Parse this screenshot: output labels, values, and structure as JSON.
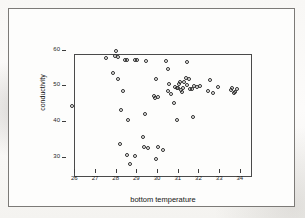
{
  "figure": {
    "background_color": "#f7f6f4",
    "border_color": "#7c7a77",
    "axis_color": "#4a4a4a",
    "marker_color": "#2e2e2e"
  },
  "chart_data": {
    "type": "scatter",
    "title": "",
    "xlabel": "bottom temperature",
    "ylabel": "conductivity",
    "xlim": [
      25.6,
      34.2
    ],
    "ylim": [
      26.5,
      61.0
    ],
    "xticks": [
      26,
      27,
      28,
      29,
      30,
      31,
      32,
      33,
      34
    ],
    "yticks": [
      30,
      40,
      50,
      60
    ],
    "xticklabels": [
      "26",
      "27",
      "28",
      "29",
      "30",
      "31",
      "32",
      "33",
      "34"
    ],
    "yticklabels": [
      "30",
      "40",
      "50",
      "60"
    ],
    "grid": false,
    "legend": false,
    "marker": "open-circle",
    "n_points": 65,
    "points": [
      [
        25.9,
        44.1
      ],
      [
        27.55,
        57.6
      ],
      [
        27.95,
        58.3
      ],
      [
        28.0,
        59.6
      ],
      [
        28.1,
        58.0
      ],
      [
        28.45,
        57.0
      ],
      [
        28.55,
        57.1
      ],
      [
        28.95,
        57.2
      ],
      [
        29.05,
        57.2
      ],
      [
        29.45,
        56.9
      ],
      [
        27.85,
        53.3
      ],
      [
        28.1,
        51.8
      ],
      [
        28.35,
        48.3
      ],
      [
        28.25,
        43.0
      ],
      [
        28.6,
        40.2
      ],
      [
        28.2,
        33.4
      ],
      [
        28.55,
        30.4
      ],
      [
        28.7,
        28.0
      ],
      [
        28.95,
        30.1
      ],
      [
        29.3,
        35.6
      ],
      [
        29.35,
        32.6
      ],
      [
        29.55,
        32.4
      ],
      [
        29.4,
        42.0
      ],
      [
        29.95,
        29.2
      ],
      [
        30.05,
        32.6
      ],
      [
        30.3,
        31.9
      ],
      [
        29.95,
        51.8
      ],
      [
        29.85,
        46.9
      ],
      [
        29.9,
        46.3
      ],
      [
        30.05,
        46.6
      ],
      [
        30.45,
        56.8
      ],
      [
        30.55,
        54.6
      ],
      [
        31.45,
        56.5
      ],
      [
        30.6,
        50.4
      ],
      [
        30.55,
        48.5
      ],
      [
        30.65,
        47.6
      ],
      [
        30.8,
        45.1
      ],
      [
        30.85,
        49.4
      ],
      [
        30.95,
        49.2
      ],
      [
        31.0,
        49.3
      ],
      [
        31.05,
        50.3
      ],
      [
        31.1,
        51.0
      ],
      [
        31.15,
        48.6
      ],
      [
        31.2,
        48.2
      ],
      [
        31.25,
        49.1
      ],
      [
        31.3,
        50.9
      ],
      [
        31.4,
        51.9
      ],
      [
        31.45,
        50.2
      ],
      [
        31.55,
        51.8
      ],
      [
        31.6,
        49.0
      ],
      [
        31.7,
        48.8
      ],
      [
        31.8,
        49.9
      ],
      [
        31.95,
        49.4
      ],
      [
        32.05,
        49.7
      ],
      [
        30.95,
        40.3
      ],
      [
        31.75,
        41.2
      ],
      [
        32.45,
        48.3
      ],
      [
        32.55,
        51.5
      ],
      [
        32.7,
        47.9
      ],
      [
        32.95,
        49.5
      ],
      [
        33.55,
        48.6
      ],
      [
        33.6,
        49.2
      ],
      [
        33.7,
        47.8
      ],
      [
        33.75,
        48.0
      ],
      [
        33.85,
        49.0
      ]
    ]
  }
}
